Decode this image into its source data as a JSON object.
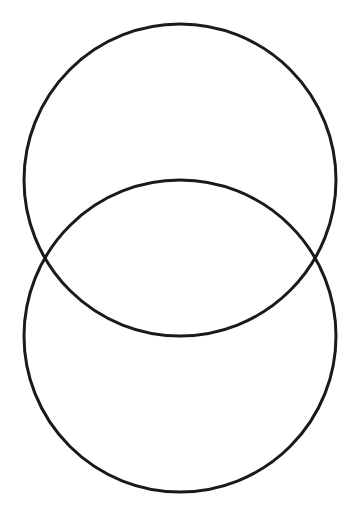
{
  "diagram": {
    "type": "overlapping-circles",
    "background": "#ffffff",
    "stroke_color": "#1a1a1a",
    "stroke_width": 3,
    "circles": [
      {
        "name": "top-circle",
        "cx": 180,
        "cy": 180,
        "r": 156
      },
      {
        "name": "bottom-circle",
        "cx": 180,
        "cy": 336,
        "r": 156
      }
    ]
  }
}
